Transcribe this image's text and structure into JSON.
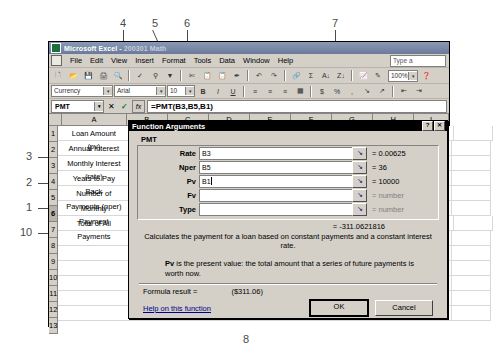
{
  "window": {
    "title_app": "Microsoft Excel - ",
    "title_doc": "200301 Math",
    "icon": "excel-icon"
  },
  "menubar": {
    "items": [
      "File",
      "Edit",
      "View",
      "Insert",
      "Format",
      "Tools",
      "Data",
      "Window",
      "Help"
    ],
    "ask_box": "Type a "
  },
  "toolbar": {
    "buttons": [
      "new-icon",
      "open-icon",
      "save-icon",
      "print-icon",
      "print-preview-icon",
      "spelling-icon",
      "research-icon",
      "filter-icon",
      "cut-icon",
      "copy-icon",
      "paste-icon",
      "format-painter-icon",
      "undo-icon",
      "redo-icon",
      "hyperlink-icon",
      "autosum-icon",
      "sort-asc-icon",
      "sort-desc-icon",
      "chart-icon",
      "drawing-icon"
    ],
    "zoom_value": "100%"
  },
  "format_toolbar": {
    "style_box": "Currency",
    "font_box": "Arial",
    "size_box": "10",
    "buttons": [
      "bold-icon",
      "italic-icon",
      "underline-icon",
      "align-left-icon",
      "align-center-icon",
      "align-right-icon",
      "merge-cells-icon",
      "currency-icon",
      "percent-icon",
      "comma-icon",
      "increase-decimal-icon",
      "decrease-decimal-icon",
      "decrease-indent-icon",
      "increase-indent-icon"
    ]
  },
  "formula_bar": {
    "name_box": "PMT",
    "cancel_icon": "✕",
    "enter_icon": "✓",
    "function_icon": "fx",
    "formula": "=PMT(B3,B5,B1)"
  },
  "grid": {
    "columns": [
      "A",
      "B",
      "C",
      "D",
      "E",
      "F",
      "G",
      "H",
      "I"
    ],
    "rows": [
      "1",
      "2",
      "3",
      "4",
      "5",
      "6",
      "7",
      "8",
      "9",
      "10",
      "11",
      "12",
      "13"
    ],
    "cells_a": [
      "Loan Amount",
      "Annual Interest",
      "Monthly Interest",
      "Years to Pay",
      "Number of",
      "Monthly",
      "Total of All",
      "",
      "",
      "",
      "",
      "",
      ""
    ],
    "cells_a_second_line": {
      "1": "(pv)",
      "3": "(rate)",
      "4": "Back",
      "5": "Payments (nper)",
      "6": "Payment",
      "7": "Payments"
    },
    "cells_b": {
      "1": "$",
      "6": "B3,B5",
      "7": "$"
    },
    "selected_row": "6"
  },
  "dialog": {
    "title": "Function Arguments",
    "help_btn": "?",
    "close_btn": "✕",
    "function_name": "PMT",
    "collapse_icon": "collapse-dialog-icon",
    "args": [
      {
        "label": "Rate",
        "value": "B3",
        "result": "0.00625",
        "empty": false
      },
      {
        "label": "Nper",
        "value": "B5",
        "result": "36",
        "empty": false
      },
      {
        "label": "Pv",
        "value": "B1",
        "result": "10000",
        "empty": false,
        "focused": true
      },
      {
        "label": "Fv",
        "value": "",
        "result": "number",
        "empty": true
      },
      {
        "label": "Type",
        "value": "",
        "result": "number",
        "empty": true
      }
    ],
    "interim_result": "=  -311.0621816",
    "description": "Calculates the payment for a loan based on constant payments and a constant interest rate.",
    "arg_help_bold": "Pv",
    "arg_help_text": " is the present value: the total amount that a series of future payments is worth now.",
    "formula_result_label": "Formula result =",
    "formula_result_value": "($311.06)",
    "help_link": "Help on this function",
    "ok_button": "OK",
    "cancel_button": "Cancel"
  },
  "callouts": [
    {
      "id": "1",
      "x": 28,
      "y": 202
    },
    {
      "id": "2",
      "x": 28,
      "y": 177
    },
    {
      "id": "3",
      "x": 28,
      "y": 151
    },
    {
      "id": "4",
      "x": 120,
      "y": 17
    },
    {
      "id": "5",
      "x": 152,
      "y": 17
    },
    {
      "id": "6",
      "x": 184,
      "y": 17
    },
    {
      "id": "7",
      "x": 332,
      "y": 17
    },
    {
      "id": "8",
      "x": 244,
      "y": 334
    },
    {
      "id": "9",
      "x": 443,
      "y": 258
    },
    {
      "id": "10",
      "x": 24,
      "y": 228
    }
  ]
}
